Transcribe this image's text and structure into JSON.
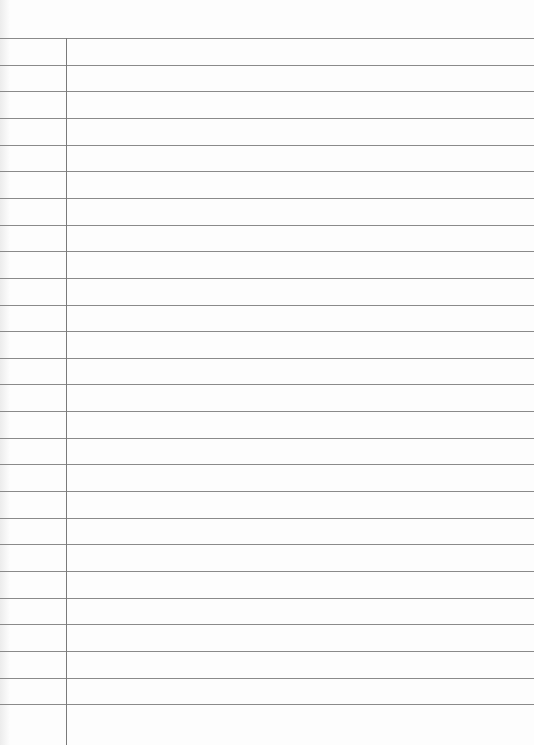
{
  "paper": {
    "type": "ruled-notebook-page",
    "line_count": 26,
    "first_line_y": 38,
    "line_spacing": 26.65,
    "margin_x": 66,
    "colors": {
      "background": "#fdfdfd",
      "rule": "#8a8a8a",
      "margin_line": "#7a7a7a"
    }
  }
}
